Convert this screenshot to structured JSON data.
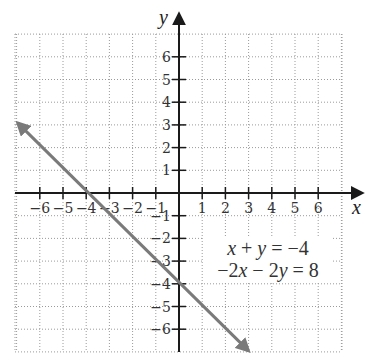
{
  "chart_data": {
    "type": "line",
    "title": "",
    "xlabel": "x",
    "ylabel": "y",
    "xlim": [
      -7,
      7
    ],
    "ylim": [
      -7,
      7
    ],
    "grid": true,
    "grid_style": "dotted",
    "x_ticks": [
      -6,
      -5,
      -4,
      -3,
      -2,
      -1,
      1,
      2,
      3,
      4,
      5,
      6
    ],
    "y_ticks": [
      -6,
      -5,
      -4,
      -3,
      -2,
      -1,
      1,
      2,
      3,
      4,
      5,
      6
    ],
    "x_tick_labels": [
      "−6",
      "−5",
      "−4",
      "−3",
      "−2",
      "−1",
      "1",
      "2",
      "3",
      "4",
      "5",
      "6"
    ],
    "y_tick_labels": [
      "−6",
      "−5",
      "−4",
      "−3",
      "−2",
      "−1",
      "1",
      "2",
      "3",
      "4",
      "5",
      "6"
    ],
    "series": [
      {
        "name": "x + y = −4",
        "equation": "y = -x - 4",
        "x": [
          -7,
          3
        ],
        "y": [
          3,
          -7
        ],
        "color": "#7a7a7a",
        "arrows": "both"
      }
    ],
    "annotations": [
      {
        "text": "x + y = −4",
        "line": 1
      },
      {
        "text": "−2x − 2y = 8",
        "line": 2
      }
    ],
    "intercepts": {
      "x_intercept": -4,
      "y_intercept": -4
    }
  },
  "colors": {
    "axis": "#1a1a1a",
    "grid": "#9a9a9a",
    "line": "#7a7a7a"
  }
}
